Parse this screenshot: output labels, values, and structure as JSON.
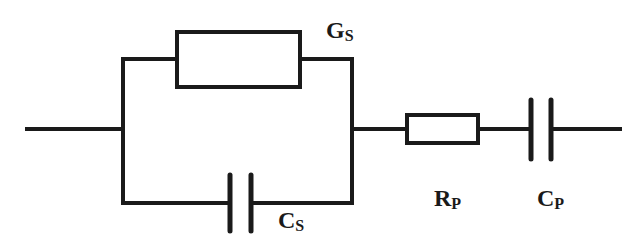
{
  "diagram": {
    "type": "equivalent-circuit",
    "colors": {
      "stroke": "#1a1a1a",
      "background": "#ffffff"
    },
    "components": [
      {
        "id": "Gs",
        "kind": "resistor",
        "label_main": "G",
        "label_sub": "S",
        "position": "parallel-top"
      },
      {
        "id": "Cs",
        "kind": "capacitor",
        "label_main": "C",
        "label_sub": "S",
        "position": "parallel-bottom"
      },
      {
        "id": "Rp",
        "kind": "resistor",
        "label_main": "R",
        "label_sub": "P",
        "position": "series"
      },
      {
        "id": "Cp",
        "kind": "capacitor",
        "label_main": "C",
        "label_sub": "P",
        "position": "series"
      }
    ],
    "topology": "(Gs || Cs) - Rp - Cp"
  }
}
